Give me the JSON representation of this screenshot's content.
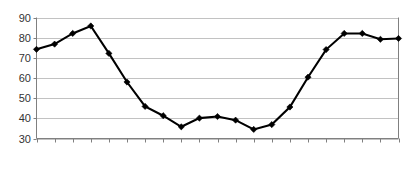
{
  "chart_data": {
    "type": "line",
    "title": "",
    "subtitle": "",
    "xlabel": "",
    "ylabel": "",
    "categories": [
      "1950",
      "1955",
      "1960",
      "1965",
      "1970",
      "1975",
      "1980",
      "1985",
      "1990",
      "1995",
      "2000",
      "2005",
      "2010",
      "2015",
      "2020",
      "2025",
      "2030",
      "2035",
      "2040",
      "2045",
      "2050"
    ],
    "values": [
      74.2,
      76.8,
      82.1,
      85.8,
      72.2,
      58.0,
      45.9,
      41.3,
      35.8,
      40.1,
      40.9,
      39.1,
      34.5,
      36.9,
      45.6,
      60.4,
      74.1,
      82.1,
      82.1,
      79.2,
      79.6
    ],
    "series": [
      {
        "name": "series-1",
        "values": [
          74.2,
          76.8,
          82.1,
          85.8,
          72.2,
          58.0,
          45.9,
          41.3,
          35.8,
          40.1,
          40.9,
          39.1,
          34.5,
          36.9,
          45.6,
          60.4,
          74.1,
          82.1,
          82.1,
          79.2,
          79.6
        ],
        "color": "#000000",
        "marker": "diamond"
      }
    ],
    "ylim": [
      30,
      90
    ],
    "yticks": [
      30,
      40,
      50,
      60,
      70,
      80,
      90
    ],
    "ytick_labels": [
      "30",
      "40",
      "50",
      "60",
      "70",
      "80",
      "90"
    ],
    "xtick_labels": [
      "1950",
      "1955",
      "1960",
      "1965",
      "1970",
      "1975",
      "1980",
      "1985",
      "1990",
      "1995",
      "2000",
      "2005",
      "2010",
      "2015",
      "2020",
      "2025",
      "2030",
      "2035",
      "2040",
      "2045",
      "2050"
    ],
    "grid": "horizontal",
    "legend": "none",
    "xlabel_rotation": -90,
    "colors": {
      "line": "#000000",
      "marker": "#000000",
      "gridline": "#b3b3b3",
      "axis": "#808080",
      "text": "#333333",
      "background": "#ffffff"
    }
  }
}
